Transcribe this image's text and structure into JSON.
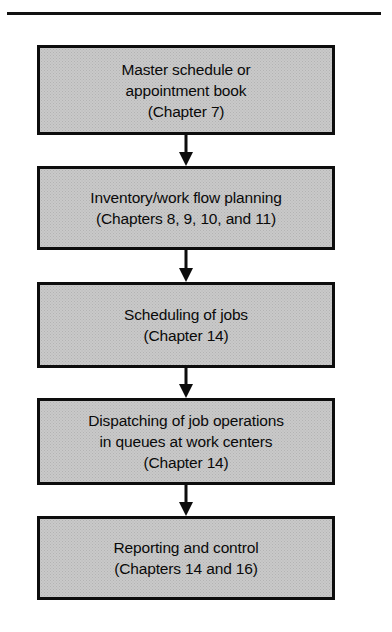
{
  "figure": {
    "separator": "top-horizontal-rule"
  },
  "flow": {
    "nodes": [
      {
        "id": "master-schedule",
        "lines": [
          "Master schedule or",
          "appointment book",
          "(Chapter 7)"
        ]
      },
      {
        "id": "inventory-work-flow-planning",
        "lines": [
          "Inventory/work flow planning",
          "(Chapters 8, 9, 10, and 11)"
        ]
      },
      {
        "id": "scheduling-of-jobs",
        "lines": [
          "Scheduling of jobs",
          "(Chapter 14)"
        ]
      },
      {
        "id": "dispatching-of-job-operations",
        "lines": [
          "Dispatching of job operations",
          "in queues at work centers",
          "(Chapter 14)"
        ]
      },
      {
        "id": "reporting-and-control",
        "lines": [
          "Reporting and control",
          "(Chapters 14 and 16)"
        ]
      }
    ],
    "connectors": [
      {
        "id": "connector-1-2",
        "direction": "down"
      },
      {
        "id": "connector-2-3",
        "direction": "down"
      },
      {
        "id": "connector-3-4",
        "direction": "down"
      },
      {
        "id": "connector-4-5",
        "direction": "down"
      }
    ]
  },
  "style": {
    "box_fill": "#c9c9c9",
    "box_border": "#0d0d0d",
    "text_color": "#0a0a0a",
    "rule_color": "#111111"
  }
}
